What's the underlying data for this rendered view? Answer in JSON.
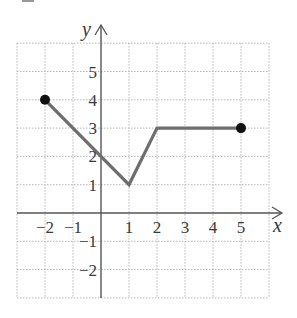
{
  "chart_data": {
    "type": "line",
    "title": "",
    "xlabel": "x",
    "ylabel": "y",
    "xlim": [
      -3,
      6
    ],
    "ylim": [
      -3,
      6
    ],
    "grid": true,
    "grid_style": "dotted",
    "x_ticks": [
      -2,
      -1,
      1,
      2,
      3,
      4,
      5
    ],
    "y_ticks": [
      -2,
      -1,
      1,
      2,
      3,
      4,
      5
    ],
    "x_tick_labels": [
      "−2",
      "−1",
      "1",
      "2",
      "3",
      "4",
      "5"
    ],
    "y_tick_labels": [
      "−2",
      "−1",
      "1",
      "2",
      "3",
      "4",
      "5"
    ],
    "series": [
      {
        "name": "piecewise function",
        "points": [
          [
            -2,
            4
          ],
          [
            1,
            1
          ],
          [
            2,
            3
          ],
          [
            5,
            3
          ]
        ],
        "closed_endpoints": [
          [
            -2,
            4
          ],
          [
            5,
            3
          ]
        ],
        "color": "#6e6e6e"
      }
    ],
    "legend": null
  },
  "colors": {
    "line": "#6e6e6e",
    "endpoint": "#111111",
    "axis": "#555555",
    "grid": "#b8b8b8"
  }
}
